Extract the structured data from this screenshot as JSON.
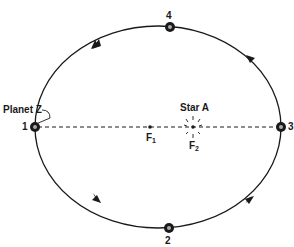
{
  "diagram": {
    "type": "elliptical-orbit",
    "planet_label": "Planet Z",
    "star_label": "Star A",
    "foci": [
      {
        "label": "F",
        "sub": "1"
      },
      {
        "label": "F",
        "sub": "2"
      }
    ],
    "positions": [
      {
        "id": "1",
        "label": "1"
      },
      {
        "id": "2",
        "label": "2"
      },
      {
        "id": "3",
        "label": "3"
      },
      {
        "id": "4",
        "label": "4"
      }
    ],
    "orbit_direction": "counterclockwise",
    "colors": {
      "line": "#1a1a1a",
      "background": "#ffffff"
    }
  }
}
